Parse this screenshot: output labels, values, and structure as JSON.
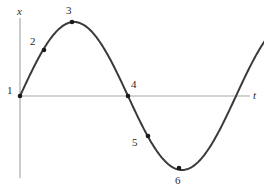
{
  "figure": {
    "background_color": "#ffffff",
    "curve_color": "#3a3a3a",
    "axis_color": "#a8a8a8",
    "marker_color": "#1a1a1a",
    "text_color": "#2b2b2b"
  },
  "axes": {
    "y_label": "x",
    "t_label": "t",
    "origin_px": {
      "x": 20,
      "y": 96
    },
    "y_axis_px": {
      "x": 20,
      "y_top": 18,
      "y_bottom": 178
    },
    "t_axis_px": {
      "y": 96,
      "x_left": 20,
      "x_right": 250
    }
  },
  "chart_data": {
    "type": "line",
    "title": "",
    "xlabel": "t",
    "ylabel": "x",
    "grid": false,
    "legend": null,
    "xlim": [
      0,
      1.15
    ],
    "ylim": [
      -1.15,
      1.15
    ],
    "series": [
      {
        "name": "x(t)",
        "curve": "sine",
        "amplitude": 1.0,
        "period": 1.0,
        "phase": 0,
        "x": [
          0.0,
          0.05,
          0.1,
          0.15,
          0.2,
          0.25,
          0.3,
          0.35,
          0.4,
          0.45,
          0.5,
          0.55,
          0.6,
          0.65,
          0.7,
          0.75,
          0.8,
          0.85,
          0.9,
          0.95,
          1.0,
          1.05,
          1.1
        ],
        "values": [
          0.0,
          0.309,
          0.588,
          0.809,
          0.951,
          1.0,
          0.951,
          0.809,
          0.588,
          0.309,
          0.0,
          -0.309,
          -0.588,
          -0.809,
          -0.951,
          -1.0,
          -0.951,
          -0.809,
          -0.588,
          -0.309,
          0.0,
          0.309,
          0.588
        ]
      }
    ],
    "annotations": [
      {
        "label": "1",
        "t": 0.0,
        "x": 0.0,
        "marker": true,
        "px": {
          "x": 20,
          "y": 96
        },
        "label_px": {
          "x": 7,
          "y": 85
        }
      },
      {
        "label": "2",
        "t": 0.16,
        "x": 0.834,
        "marker": true,
        "px": {
          "x": 44,
          "y": 50
        },
        "label_px": {
          "x": 30,
          "y": 36
        }
      },
      {
        "label": "3",
        "t": 0.25,
        "x": 1.0,
        "marker": true,
        "px": {
          "x": 72,
          "y": 22
        },
        "label_px": {
          "x": 66,
          "y": 5
        }
      },
      {
        "label": "4",
        "t": 0.5,
        "x": 0.0,
        "marker": true,
        "px": {
          "x": 128,
          "y": 96
        },
        "label_px": {
          "x": 131,
          "y": 79
        }
      },
      {
        "label": "5",
        "t": 0.63,
        "x": -0.724,
        "marker": true,
        "px": {
          "x": 148,
          "y": 136
        },
        "label_px": {
          "x": 132,
          "y": 137
        }
      },
      {
        "label": "6",
        "t": 0.75,
        "x": -1.0,
        "marker": true,
        "px": {
          "x": 179,
          "y": 168
        },
        "label_px": {
          "x": 175,
          "y": 175
        }
      }
    ]
  }
}
